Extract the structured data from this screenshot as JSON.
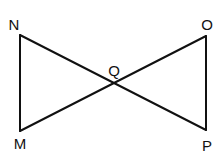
{
  "diagram": {
    "points": {
      "N": {
        "label": "N",
        "x": 20,
        "y": 35,
        "lx": 14,
        "ly": 30
      },
      "M": {
        "label": "M",
        "x": 20,
        "y": 131,
        "lx": 20,
        "ly": 149
      },
      "O": {
        "label": "O",
        "x": 206,
        "y": 36,
        "lx": 207,
        "ly": 30
      },
      "P": {
        "label": "P",
        "x": 206,
        "y": 130,
        "lx": 207,
        "ly": 151
      },
      "Q": {
        "label": "Q",
        "x": 113,
        "y": 84,
        "lx": 114,
        "ly": 76
      }
    },
    "segments": [
      "NM",
      "NP",
      "MO",
      "OP"
    ],
    "stroke_color": "#111111"
  }
}
